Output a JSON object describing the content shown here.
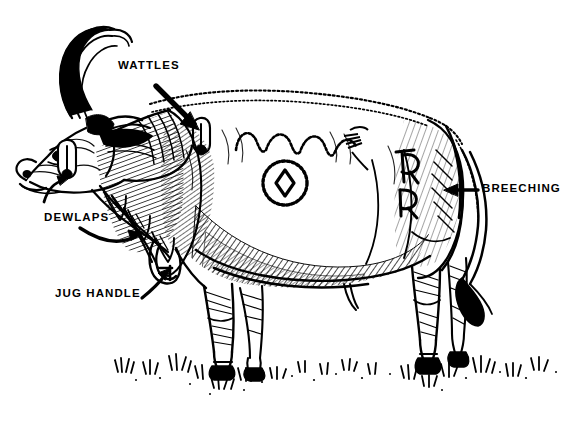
{
  "figure": {
    "style": "black and white pen-and-ink line drawing",
    "background_color": "#ffffff",
    "ink_color": "#000000",
    "width": 569,
    "height": 428
  },
  "labels": [
    {
      "id": "wattles",
      "text": "WATTLES",
      "x": 118,
      "y": 60,
      "arrow": "straight-arrow-down-right"
    },
    {
      "id": "dewlaps",
      "text": "DEWLAPS",
      "x": 44,
      "y": 212,
      "arrow": "curved-arrow-right"
    },
    {
      "id": "jug_handle",
      "text": "JUG HANDLE",
      "x": 55,
      "y": 288,
      "arrow": "straight-arrow-up-right"
    },
    {
      "id": "breeching",
      "text": "BREECHING",
      "x": 482,
      "y": 183,
      "arrow": "straight-arrow-left"
    }
  ],
  "brands": [
    {
      "id": "circle-diamond",
      "description": "circle enclosing a diamond",
      "x": 285,
      "y": 183
    },
    {
      "id": "wavy-line",
      "description": "scalloped wavy arches",
      "x": 300,
      "y": 138
    },
    {
      "id": "letter-r-top",
      "description": "letter R brand",
      "x": 410,
      "y": 168
    },
    {
      "id": "letter-r-bottom",
      "description": "letter R brand",
      "x": 410,
      "y": 200
    }
  ],
  "anatomy_parts": [
    "horns",
    "ear",
    "muzzle",
    "wattle-jaw",
    "wattle-neck",
    "dewlap",
    "jug-handle",
    "brisket",
    "barrel",
    "hindquarter",
    "breeching",
    "tail",
    "hooves"
  ],
  "ground": {
    "description": "grass tufts along baseline",
    "baseline_y": 370
  }
}
